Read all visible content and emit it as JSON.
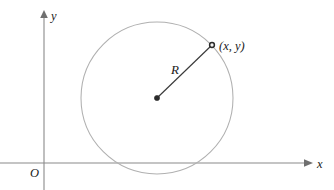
{
  "figure": {
    "background_color": "#ffffff",
    "width": 334,
    "height": 190
  },
  "axes": {
    "color": "#8a8a8a",
    "x_axis": {
      "label": "x",
      "label_x": 318,
      "label_y": 168,
      "y_position": 163,
      "x_start": 0,
      "x_end": 312
    },
    "y_axis": {
      "label": "y",
      "label_x": 51,
      "label_y": 20,
      "x_position": 44,
      "y_start": 11,
      "y_end": 190
    },
    "origin": {
      "label": "O",
      "label_x": 31,
      "label_y": 176,
      "x": 44,
      "y": 163
    }
  },
  "circle": {
    "stroke_color": "#b0b0b0",
    "center_x": 157,
    "center_y": 98,
    "radius": 76
  },
  "center_point": {
    "name": "circle-center",
    "x": 157,
    "y": 98,
    "color": "#2b2b2b",
    "dot_radius": 2.6
  },
  "radius_segment": {
    "label": "R",
    "label_x": 172,
    "label_y": 74,
    "color": "#3a3a3a",
    "x1": 157,
    "y1": 98,
    "x2": 212,
    "y2": 45
  },
  "boundary_point": {
    "label": "(x, y)",
    "label_x": 219,
    "label_y": 50,
    "x": 212,
    "y": 45,
    "color": "#2b2b2b",
    "dot_radius": 2.4
  }
}
